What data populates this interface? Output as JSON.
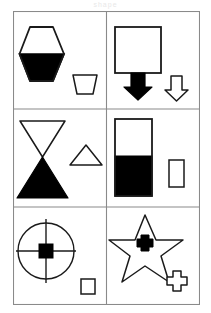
{
  "header": {
    "watermark_text": "shape"
  },
  "figure": {
    "columns": 2,
    "rows": 3,
    "stroke_color": "#1a1a1a",
    "fill_color": "#000000",
    "background_color": "#ffffff",
    "border_color": "#8a8a8a"
  },
  "panels": [
    {
      "id": "panel-1",
      "position": "top-left",
      "main_shape": {
        "name": "hexagon-half-filled",
        "type": "hexagon",
        "fill_style": "bottom-half-black",
        "fill_fraction": 0.5
      },
      "small_shape": {
        "name": "trapezoid-outline",
        "type": "trapezoid",
        "fill_style": "white-outline"
      }
    },
    {
      "id": "panel-2",
      "position": "top-right",
      "main_shape": {
        "name": "square-with-black-arrow",
        "type": "square-arrow",
        "fill_style": "white-square-black-arrow",
        "fill_fraction": 0.0
      },
      "small_shape": {
        "name": "down-arrow-outline",
        "type": "arrow-down",
        "fill_style": "white-outline"
      }
    },
    {
      "id": "panel-3",
      "position": "middle-left",
      "main_shape": {
        "name": "hourglass-half-filled",
        "type": "hourglass",
        "fill_style": "bottom-triangle-black",
        "fill_fraction": 0.5
      },
      "small_shape": {
        "name": "triangle-outline",
        "type": "triangle",
        "fill_style": "white-outline"
      }
    },
    {
      "id": "panel-4",
      "position": "middle-right",
      "main_shape": {
        "name": "rectangle-part-filled",
        "type": "rectangle",
        "fill_style": "bottom-portion-black",
        "fill_fraction": 0.55
      },
      "small_shape": {
        "name": "rectangle-outline",
        "type": "rectangle",
        "fill_style": "white-outline"
      }
    },
    {
      "id": "panel-5",
      "position": "bottom-left",
      "main_shape": {
        "name": "crosshair-circle-with-black-square",
        "type": "circle-crosshair",
        "fill_style": "center-square-black",
        "fill_fraction": 0.1
      },
      "small_shape": {
        "name": "square-outline",
        "type": "square",
        "fill_style": "white-outline"
      }
    },
    {
      "id": "panel-6",
      "position": "bottom-right",
      "main_shape": {
        "name": "star-with-black-cross",
        "type": "star",
        "fill_style": "center-cross-black",
        "fill_fraction": 0.1
      },
      "small_shape": {
        "name": "cross-outline",
        "type": "cross",
        "fill_style": "white-outline"
      }
    }
  ]
}
